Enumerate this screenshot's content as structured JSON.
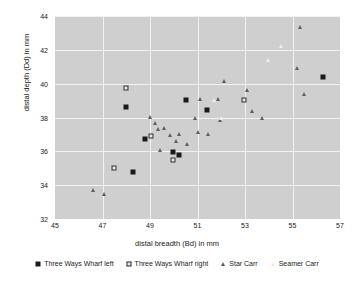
{
  "chart_data": {
    "type": "scatter",
    "title": "",
    "xlabel": "distal breadth (Bd) in mm",
    "ylabel": "distal depth (Dd) in mm",
    "xlim": [
      45,
      57
    ],
    "ylim": [
      32,
      44
    ],
    "xticks": [
      45,
      47,
      49,
      51,
      53,
      55,
      57
    ],
    "yticks": [
      32,
      34,
      36,
      38,
      40,
      42,
      44
    ],
    "grid": true,
    "legend_position": "bottom",
    "series": [
      {
        "name": "Three Ways Wharf left",
        "marker": "filled-square",
        "color": "#1a1a1a",
        "points": [
          [
            48.0,
            38.6
          ],
          [
            48.3,
            34.8
          ],
          [
            48.8,
            36.75
          ],
          [
            49.95,
            35.95
          ],
          [
            50.2,
            35.8
          ],
          [
            50.5,
            39.05
          ],
          [
            51.4,
            38.45
          ],
          [
            56.3,
            40.4
          ]
        ]
      },
      {
        "name": "Three Ways Wharf right",
        "marker": "open-square",
        "color": "#2b2b2b",
        "points": [
          [
            47.5,
            35.0
          ],
          [
            48.0,
            39.75
          ],
          [
            49.05,
            36.9
          ],
          [
            49.95,
            35.5
          ],
          [
            52.95,
            39.05
          ]
        ]
      },
      {
        "name": "Star Carr",
        "marker": "triangle",
        "color": "#5e5e5e",
        "points": [
          [
            46.6,
            33.7
          ],
          [
            47.05,
            33.5
          ],
          [
            49.0,
            38.05
          ],
          [
            49.2,
            37.65
          ],
          [
            49.35,
            37.3
          ],
          [
            49.4,
            36.1
          ],
          [
            49.6,
            37.4
          ],
          [
            49.85,
            36.95
          ],
          [
            50.1,
            36.6
          ],
          [
            50.2,
            37.05
          ],
          [
            50.55,
            36.45
          ],
          [
            50.9,
            37.95
          ],
          [
            51.0,
            37.15
          ],
          [
            51.1,
            39.1
          ],
          [
            51.45,
            37.0
          ],
          [
            51.85,
            39.1
          ],
          [
            51.95,
            37.85
          ],
          [
            52.1,
            40.15
          ],
          [
            53.1,
            39.65
          ],
          [
            53.3,
            38.4
          ],
          [
            53.7,
            37.95
          ],
          [
            55.2,
            40.9
          ],
          [
            55.3,
            43.35
          ],
          [
            55.5,
            39.4
          ]
        ]
      },
      {
        "name": "Seamer Carr",
        "marker": "light-triangle",
        "color": "#ededed",
        "points": [
          [
            51.7,
            39.05
          ],
          [
            52.0,
            38.0
          ],
          [
            53.95,
            41.4
          ],
          [
            54.5,
            42.25
          ]
        ]
      }
    ]
  },
  "legend": {
    "items": [
      {
        "label": "Three Ways Wharf left",
        "marker_class": "m-twwl"
      },
      {
        "label": "Three Ways Wharf right",
        "marker_class": "m-twwr"
      },
      {
        "label": "Star Carr",
        "marker_class": "m-star"
      },
      {
        "label": "Seamer Carr",
        "marker_class": "m-seamer"
      }
    ]
  }
}
